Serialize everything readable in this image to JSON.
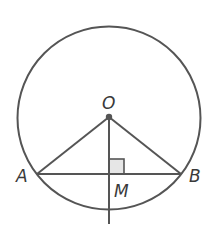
{
  "diagram": {
    "type": "geometry",
    "labels": {
      "center": "O",
      "point_a": "A",
      "point_b": "B",
      "foot": "M"
    },
    "colors": {
      "stroke": "#555555",
      "right_angle_fill": "#e6e6e6"
    }
  }
}
